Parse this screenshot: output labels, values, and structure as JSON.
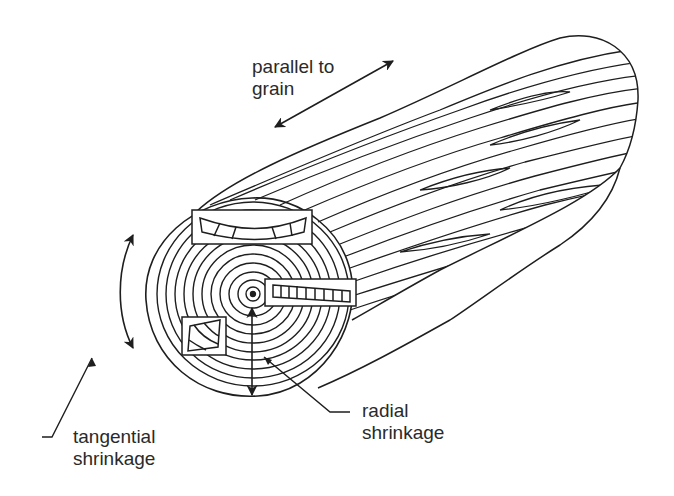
{
  "diagram": {
    "labels": {
      "parallel": {
        "line1": "parallel to",
        "line2": "grain"
      },
      "tangential": {
        "line1": "tangential",
        "line2": "shrinkage"
      },
      "radial": {
        "line1": "radial",
        "line2": "shrinkage"
      }
    },
    "features": [
      "log-body-grain",
      "log-end-growth-rings",
      "pith-center",
      "tangential-sample-bowed",
      "radial-sample-tapered",
      "diamond-sample-square",
      "radial-arrow-vertical",
      "tangential-arc-arrow",
      "parallel-grain-arrow"
    ],
    "colors": {
      "line": "#1e1e1e",
      "text": "#2a2a2a",
      "background": "#ffffff"
    }
  }
}
